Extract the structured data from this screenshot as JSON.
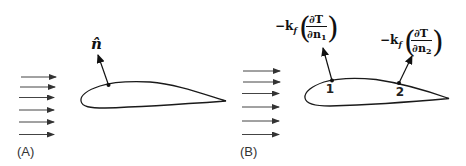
{
  "figure": {
    "panels": [
      {
        "id": "A",
        "label": "(A)",
        "flow_arrow_count": 6,
        "normal_label": "n̂",
        "points": []
      },
      {
        "id": "B",
        "label": "(B)",
        "flow_arrow_count": 6,
        "points": [
          {
            "label": "1",
            "flux_prefix": "−k",
            "flux_sub": "f",
            "numerator": "∂T",
            "denominator": "∂n",
            "denominator_sub": "1"
          },
          {
            "label": "2",
            "flux_prefix": "−k",
            "flux_sub": "f",
            "numerator": "∂T",
            "denominator": "∂n",
            "denominator_sub": "2"
          }
        ]
      }
    ],
    "colors": {
      "stroke": "#1a1a1a",
      "flow_arrows": "#444444",
      "background": "#ffffff"
    }
  }
}
